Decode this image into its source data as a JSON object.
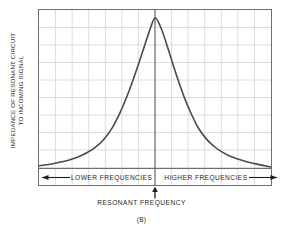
{
  "figure": {
    "caption": "(B)",
    "y_axis_label_line1": "IMPEDANCE OF RESONANT CIRCUIT",
    "y_axis_label_line2": "TO INCOMING SIGNAL",
    "lower_frequencies_label": "LOWER FREQUENCIES",
    "higher_frequencies_label": "HIGHER FREQUENCIES",
    "resonant_frequency_label": "RESONANT FREQUENCY",
    "colors": {
      "curve": "#4a4a4a",
      "frame": "#6e6e6e",
      "grid": "#dcdcdc",
      "center_line": "#5a5a5a",
      "text": "#1f1f1f",
      "background": "#ffffff"
    }
  },
  "chart_data": {
    "type": "line",
    "title": "",
    "subtitle": "",
    "xlabel": "RESONANT FREQUENCY",
    "ylabel": "IMPEDANCE OF RESONANT CIRCUIT TO INCOMING SIGNAL",
    "xlim": [
      -1,
      1
    ],
    "ylim": [
      0,
      1
    ],
    "grid": true,
    "grid_cols": 14,
    "grid_rows": 10,
    "legend": [],
    "legend_position": "none",
    "axis_tick_labels": {
      "x": [],
      "y": []
    },
    "annotations": [
      {
        "text": "LOWER FREQUENCIES",
        "x": -0.5,
        "y": 0.04,
        "arrow": "left"
      },
      {
        "text": "HIGHER FREQUENCIES",
        "x": 0.5,
        "y": 0.04,
        "arrow": "right"
      },
      {
        "text": "RESONANT FREQUENCY",
        "x": 0.0,
        "y": -0.12,
        "arrow": "up"
      }
    ],
    "center_marker_x": 0.0,
    "peak": {
      "x": 0.0,
      "y": 0.955
    },
    "baseline": {
      "left_y": 0.11,
      "right_y": 0.1
    },
    "series": [
      {
        "name": "Resonant circuit impedance",
        "x": [
          -1.0,
          -0.93,
          -0.86,
          -0.79,
          -0.72,
          -0.65,
          -0.58,
          -0.51,
          -0.44,
          -0.37,
          -0.3,
          -0.25,
          -0.2,
          -0.15,
          -0.1,
          -0.05,
          0.0,
          0.05,
          0.1,
          0.15,
          0.2,
          0.25,
          0.3,
          0.37,
          0.44,
          0.51,
          0.58,
          0.65,
          0.72,
          0.79,
          0.86,
          0.93,
          1.0
        ],
        "y": [
          0.11,
          0.116,
          0.124,
          0.134,
          0.147,
          0.164,
          0.187,
          0.218,
          0.262,
          0.325,
          0.415,
          0.493,
          0.58,
          0.676,
          0.776,
          0.875,
          0.955,
          0.9,
          0.805,
          0.7,
          0.598,
          0.505,
          0.425,
          0.33,
          0.265,
          0.22,
          0.188,
          0.164,
          0.147,
          0.133,
          0.122,
          0.112,
          0.103
        ]
      }
    ]
  }
}
